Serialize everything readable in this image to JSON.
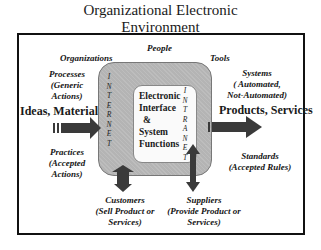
{
  "title": {
    "line1": "Organizational Electronic",
    "line2": "Environment"
  },
  "labels": {
    "people": "People",
    "organizations": "Organizations",
    "tools": "Tools",
    "processes": [
      "Processes",
      "(Generic",
      "Actions)"
    ],
    "practices": [
      "Practices",
      "(Accepted",
      "Actions)"
    ],
    "systems": [
      "Systems",
      "( Automated,",
      "Not-Automated)"
    ],
    "standards": [
      "Standards",
      "(Accepted Rules)"
    ],
    "customers": [
      "Customers",
      "(Sell Product or",
      "Services)"
    ],
    "suppliers": [
      "Suppliers",
      "(Provide Product or",
      "Services)"
    ]
  },
  "flows": {
    "input": "Ideas, Materials",
    "output": "Products, Services"
  },
  "core": {
    "lines": [
      "Electronic",
      "Interface",
      "&",
      "System",
      "Functions"
    ]
  },
  "rings": {
    "internet": [
      "I",
      "N",
      "T",
      "E",
      "R",
      "N",
      "E",
      "T"
    ],
    "intranet": [
      "I",
      "N",
      "T",
      "R",
      "A",
      "N",
      "E",
      "T"
    ]
  },
  "colors": {
    "ring_fill": "#b4b4b4",
    "core_fill": "#fafafa",
    "arrow_fill": "#3a3a3a",
    "frame": "#111111"
  }
}
